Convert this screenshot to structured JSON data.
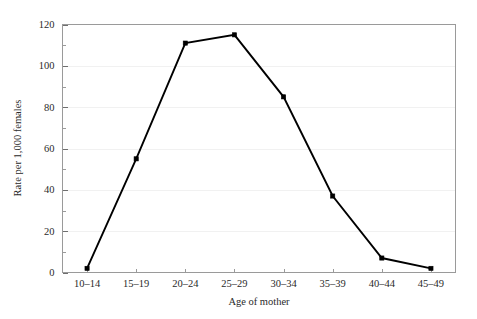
{
  "chart_data": {
    "type": "line",
    "title": "",
    "xlabel": "Age of mother",
    "ylabel": "Rate per 1,000 females",
    "categories": [
      "10–14",
      "15–19",
      "20–24",
      "25–29",
      "30–34",
      "35–39",
      "40–44",
      "45–49"
    ],
    "values": [
      2,
      55,
      111,
      115,
      85,
      37,
      7,
      2
    ],
    "ylim": [
      0,
      120
    ],
    "yticks": [
      0,
      20,
      40,
      60,
      80,
      100,
      120
    ],
    "ytick_labels": [
      "0",
      "20",
      "40",
      "60",
      "80",
      "100",
      "120"
    ],
    "yminor_ticks": [
      10,
      30,
      50,
      70,
      90,
      110
    ],
    "grid": true,
    "grid_axis": "y",
    "legend": false,
    "legend_position": "none",
    "marker": "square",
    "line_color": "#000000",
    "marker_color": "#000000",
    "background_color": "#ffffff",
    "frame_color": "#9a9a9a",
    "gridline_color": "#f1f1f1"
  },
  "axes": {
    "x_title": "Age of mother",
    "y_title": "Rate per 1,000 females"
  }
}
